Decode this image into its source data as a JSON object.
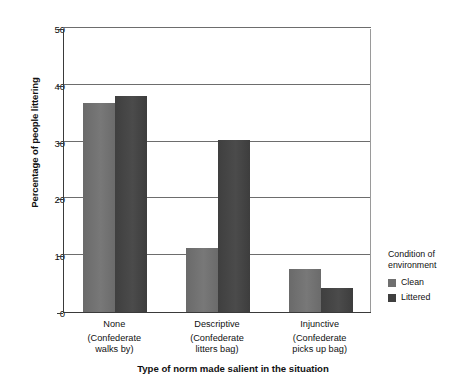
{
  "chart_data": {
    "type": "bar",
    "title": "",
    "xlabel": "Type of norm made salient in the situation",
    "ylabel": "Percentage of people littering",
    "ylim": [
      0,
      50
    ],
    "yticks": [
      0,
      10,
      20,
      30,
      40,
      50
    ],
    "grid": true,
    "legend_position": "right",
    "legend_title": "Condition of environment",
    "categories": [
      "None",
      "Descriptive",
      "Injunctive"
    ],
    "category_sublabels": [
      "(Confederate walks by)",
      "(Confederate litters bag)",
      "(Confederate picks up bag)"
    ],
    "series": [
      {
        "name": "Clean",
        "color": "#6f6f6f",
        "values": [
          36.8,
          11.3,
          7.5
        ]
      },
      {
        "name": "Littered",
        "color": "#3f3f3f",
        "values": [
          38.0,
          30.2,
          4.3
        ]
      }
    ]
  },
  "axis": {
    "y_title": "Percentage of people littering",
    "x_title": "Type of norm made salient in the situation",
    "y_tick_labels": [
      "50",
      "40",
      "30",
      "20",
      "10",
      "0"
    ]
  },
  "x_labels": [
    {
      "primary": "None",
      "line1": "(Confederate",
      "line2": "walks by)"
    },
    {
      "primary": "Descriptive",
      "line1": "(Confederate",
      "line2": "litters bag)"
    },
    {
      "primary": "Injunctive",
      "line1": "(Confederate",
      "line2": "picks up bag)"
    }
  ],
  "legend": {
    "title_line1": "Condition of",
    "title_line2": "environment",
    "items": [
      {
        "label": "Clean",
        "color": "#6f6f6f"
      },
      {
        "label": "Littered",
        "color": "#3f3f3f"
      }
    ]
  }
}
